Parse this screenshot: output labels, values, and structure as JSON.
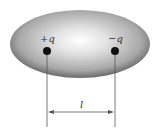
{
  "diagram": {
    "charges": [
      {
        "label": "+q",
        "x": 47,
        "y": 51
      },
      {
        "label": "−q",
        "x": 115,
        "y": 51
      }
    ],
    "distance_label": "l",
    "colors": {
      "ellipse_outer": "#5a5a5a",
      "ellipse_inner": "#ffffff",
      "charge": "#111111",
      "line": "#555555"
    }
  }
}
